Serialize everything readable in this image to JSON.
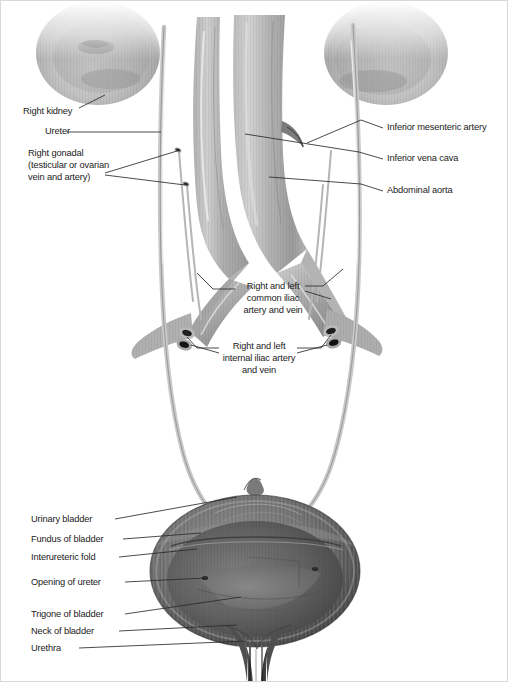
{
  "figure": {
    "type": "anatomical-illustration",
    "style": "grayscale airbrush medical illustration",
    "background_color": "#ffffff",
    "text_color": "#1b1b1b",
    "leader_line_color": "#2a2a2a"
  },
  "labels_left": [
    {
      "id": "right-kidney",
      "text": "Right kidney",
      "x": 22,
      "y": 105
    },
    {
      "id": "ureter",
      "text": "Ureter",
      "x": 44,
      "y": 133
    },
    {
      "id": "right-gonadal",
      "text": "Right gonadal",
      "x": 27,
      "y": 152
    },
    {
      "id": "right-gonadal2",
      "text": "(testicular or ovarian",
      "x": 27,
      "y": 163
    },
    {
      "id": "right-gonadal3",
      "text": "vein and artery)",
      "x": 27,
      "y": 174
    }
  ],
  "labels_right": [
    {
      "id": "inferior-mesenteric-artery",
      "text": "Inferior mesenteric artery",
      "x": 386,
      "y": 125
    },
    {
      "id": "inferior-vena-cava",
      "text": "Inferior vena cava",
      "x": 386,
      "y": 157
    },
    {
      "id": "abdominal-aorta",
      "text": "Abdominal aorta",
      "x": 386,
      "y": 189
    }
  ],
  "labels_center": [
    {
      "id": "common-iliac-1",
      "text": "Right and left",
      "x": 238,
      "y": 284
    },
    {
      "id": "common-iliac-2",
      "text": "common iliac",
      "x": 238,
      "y": 296
    },
    {
      "id": "common-iliac-3",
      "text": "artery and vein",
      "x": 238,
      "y": 308
    },
    {
      "id": "internal-iliac-1",
      "text": "Right and left",
      "x": 222,
      "y": 341
    },
    {
      "id": "internal-iliac-2",
      "text": "internal iliac artery",
      "x": 222,
      "y": 353
    },
    {
      "id": "internal-iliac-3",
      "text": "and vein",
      "x": 222,
      "y": 365
    }
  ],
  "labels_bladder": [
    {
      "id": "urinary-bladder",
      "text": "Urinary bladder",
      "x": 30,
      "y": 515
    },
    {
      "id": "fundus-of-bladder",
      "text": "Fundus of bladder",
      "x": 30,
      "y": 536
    },
    {
      "id": "interureteric-fold",
      "text": "Interureteric fold",
      "x": 30,
      "y": 553
    },
    {
      "id": "opening-of-ureter",
      "text": "Opening of ureter",
      "x": 30,
      "y": 578
    },
    {
      "id": "trigone-of-bladder",
      "text": "Trigone of bladder",
      "x": 30,
      "y": 611
    },
    {
      "id": "neck-of-bladder",
      "text": "Neck of bladder",
      "x": 30,
      "y": 628
    },
    {
      "id": "urethra",
      "text": "Urethra",
      "x": 30,
      "y": 645
    }
  ],
  "structures": [
    "right kidney",
    "left kidney",
    "ureter",
    "right gonadal vein and artery",
    "inferior mesenteric artery",
    "inferior vena cava",
    "abdominal aorta",
    "common iliac artery and vein",
    "internal iliac artery and vein",
    "urinary bladder",
    "fundus of bladder",
    "interureteric fold",
    "opening of ureter",
    "trigone of bladder",
    "neck of bladder",
    "urethra"
  ]
}
